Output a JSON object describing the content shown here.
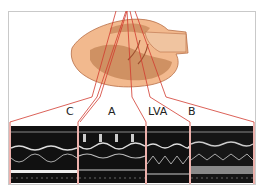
{
  "figure": {
    "type": "echocardiography M-mode diagram",
    "heart_colors": {
      "outer": "#f0b58a",
      "inner": "#c98a5c",
      "outline": "#b06a45"
    },
    "beam_color": "#d23a2e",
    "panels": [
      {
        "id": "C",
        "label": "C"
      },
      {
        "id": "A",
        "label": "A"
      },
      {
        "id": "LVA",
        "label": "LVA"
      },
      {
        "id": "B",
        "label": "B"
      }
    ]
  }
}
